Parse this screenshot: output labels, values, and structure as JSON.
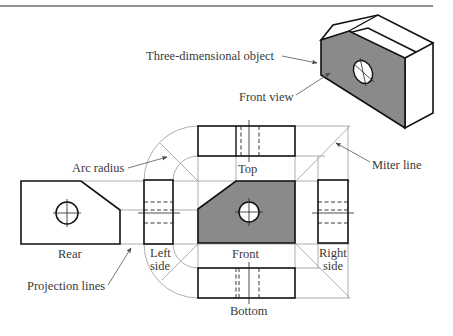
{
  "diagram": {
    "type": "orthographic-projection",
    "labels": {
      "three_d_object": "Three-dimensional object",
      "front_view_callout": "Front view",
      "arc_radius": "Arc radius",
      "miter_line": "Miter line",
      "projection_lines": "Projection lines",
      "top": "Top",
      "front": "Front",
      "bottom": "Bottom",
      "rear": "Rear",
      "left_side_1": "Left",
      "left_side_2": "side",
      "right_side_1": "Right",
      "right_side_2": "side"
    },
    "views": [
      "Top",
      "Front",
      "Bottom",
      "Rear",
      "Left side",
      "Right side"
    ],
    "colors": {
      "object_line": "#111111",
      "front_fill": "#8a8a8a",
      "projection_line": "#9a9a9a",
      "label_text": "#3a3a3a"
    }
  }
}
